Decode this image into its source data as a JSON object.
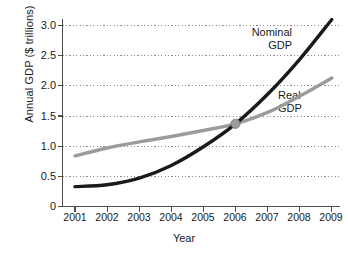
{
  "chart_data": {
    "type": "line",
    "title": "",
    "subtitle": "",
    "xlabel": "Year",
    "ylabel": "Annual GDP ($ trillions)",
    "x": [
      2001,
      2002,
      2003,
      2004,
      2005,
      2006,
      2007,
      2008,
      2009
    ],
    "xtick_labels": [
      "2001",
      "2002",
      "2003",
      "2004",
      "2005",
      "2006",
      "2007",
      "2008",
      "2009"
    ],
    "ytick_labels": [
      "0",
      "0.5",
      "1.0",
      "1.5",
      "2.0",
      "2.5",
      "3.0"
    ],
    "ytick_values": [
      0,
      0.5,
      1.0,
      1.5,
      2.0,
      2.5,
      3.0
    ],
    "xlim": [
      2000.8,
      2009.1
    ],
    "ylim": [
      0,
      3.0
    ],
    "grid": "horizontal-dotted",
    "legend_position": "inline-annotations",
    "series": [
      {
        "name": "Nominal GDP",
        "color": "#1a1a1a",
        "width": 3.4,
        "values": [
          0.33,
          0.36,
          0.47,
          0.68,
          0.99,
          1.37,
          1.86,
          2.44,
          3.1
        ]
      },
      {
        "name": "Real GDP",
        "color": "#9b9b9b",
        "width": 3.4,
        "values": [
          0.84,
          0.97,
          1.07,
          1.16,
          1.26,
          1.37,
          1.56,
          1.83,
          2.13
        ]
      }
    ],
    "annotations": [
      {
        "text": "Nominal GDP",
        "line1": "Nominal",
        "line2": "GDP",
        "near_x": 2008,
        "near_y": 2.7
      },
      {
        "text": "Real GDP",
        "line1": "Real",
        "line2": "GDP",
        "near_x": 2009,
        "near_y": 1.65
      }
    ],
    "markers": [
      {
        "name": "intersection-point",
        "x": 2006,
        "y": 1.37,
        "color": "#9b9b9b",
        "radius": 4.6
      }
    ]
  },
  "colors": {
    "nominal": "#1a1a1a",
    "real": "#9b9b9b",
    "axis": "#4d4d4d",
    "grid": "#8c8c8c",
    "text": "#1a1a1a",
    "background": "#ffffff"
  },
  "axis_titles": {
    "x": "Year",
    "y": "Annual GDP ($ trillions)"
  }
}
